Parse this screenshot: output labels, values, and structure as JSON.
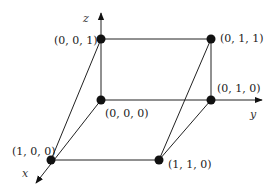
{
  "diagram": {
    "axes": {
      "x": "x",
      "y": "y",
      "z": "z"
    },
    "vertices": [
      {
        "id": "v000",
        "label": "(0, 0, 0)"
      },
      {
        "id": "v001",
        "label": "(0, 0, 1)"
      },
      {
        "id": "v011",
        "label": "(0, 1, 1)"
      },
      {
        "id": "v010",
        "label": "(0, 1, 0)"
      },
      {
        "id": "v100",
        "label": "(1, 0, 0)"
      },
      {
        "id": "v110",
        "label": "(1, 1, 0)"
      }
    ],
    "colors": {
      "stroke": "#222222",
      "point": "#111111",
      "background": "#ffffff"
    }
  }
}
